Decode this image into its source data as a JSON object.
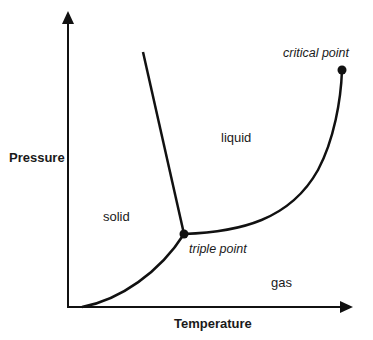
{
  "diagram": {
    "type": "phase-diagram",
    "colors": {
      "stroke": "#111111",
      "background": "#ffffff",
      "text": "#1a1a1a"
    },
    "axes": {
      "x_label": "Temperature",
      "y_label": "Pressure"
    },
    "regions": {
      "solid": "solid",
      "liquid": "liquid",
      "gas": "gas"
    },
    "points": {
      "triple": {
        "label": "triple point"
      },
      "critical": {
        "label": "critical point"
      }
    },
    "curves": [
      "sublimation curve",
      "fusion (melting) line",
      "vaporization curve"
    ]
  }
}
